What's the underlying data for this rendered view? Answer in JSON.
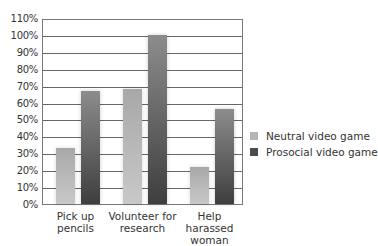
{
  "chart_data": {
    "type": "bar",
    "title": "",
    "xlabel": "",
    "ylabel": "",
    "ylim": [
      0,
      110
    ],
    "yticks": [
      "0%",
      "10%",
      "20%",
      "30%",
      "40%",
      "50%",
      "60%",
      "70%",
      "80%",
      "90%",
      "100%",
      "110%"
    ],
    "grid": true,
    "legend_position": "right",
    "categories": [
      "Pick up pencils",
      "Volunteer for research",
      "Help harassed woman"
    ],
    "category_labels": [
      [
        "Pick up pencils"
      ],
      [
        "Volunteer for",
        "research"
      ],
      [
        "Help harassed",
        "woman"
      ]
    ],
    "series": [
      {
        "name": "Neutral video game",
        "color": "#b4b4b4",
        "values": [
          33,
          68,
          22
        ]
      },
      {
        "name": "Prosocial video game",
        "color": "#4a4a4a",
        "values": [
          67,
          100,
          56
        ]
      }
    ]
  }
}
